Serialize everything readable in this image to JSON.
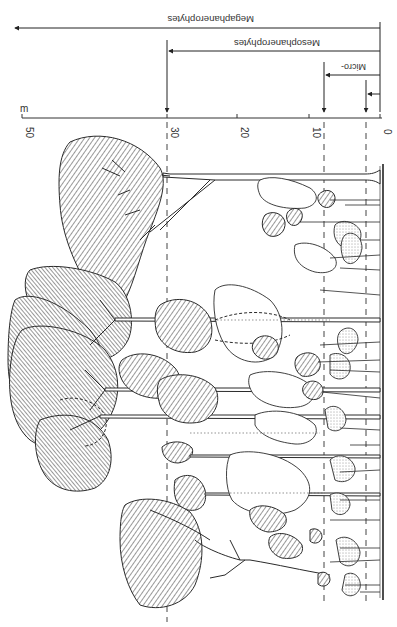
{
  "figure": {
    "orientation": "rotated 90 degrees (height axis runs horizontally, ground at right)",
    "axis": {
      "unit_label": "m",
      "ticks": [
        "0",
        "10",
        "20",
        "30",
        "50"
      ],
      "tick_values": [
        0,
        10,
        20,
        30,
        50
      ]
    },
    "height_classes": [
      {
        "name": "Nano",
        "label": "",
        "upper_limit_m": 2
      },
      {
        "name": "Micro",
        "label": "Micro-",
        "upper_limit_m": 8
      },
      {
        "name": "Meso",
        "label": "Mesophanerophytes",
        "upper_limit_m": 30
      },
      {
        "name": "Mega",
        "label": "Megaphanerophytes",
        "upper_limit_m": null
      }
    ],
    "reference_lines_m": [
      2,
      8,
      30
    ],
    "ink_color": "#2a2a2a",
    "background_color": "#ffffff"
  }
}
